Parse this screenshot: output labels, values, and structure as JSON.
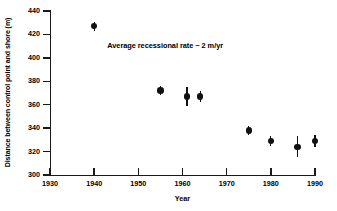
{
  "chart_data": {
    "type": "scatter",
    "title": "",
    "xlabel": "Year",
    "ylabel": "Distance between control point and shore (m)",
    "xlim": [
      1930,
      1990
    ],
    "ylim": [
      300,
      440
    ],
    "grid": false,
    "legend": "none",
    "xticks": [
      1930,
      1940,
      1950,
      1960,
      1970,
      1980,
      1990
    ],
    "yticks": [
      300,
      320,
      340,
      360,
      380,
      400,
      420,
      440
    ],
    "annotations": [
      {
        "text": "Average recessional rate ~ 2 m/yr",
        "x": 1957,
        "y": 411
      }
    ],
    "series": [
      {
        "name": "Shoreline position",
        "points": [
          {
            "x": 1940,
            "y": 427,
            "yerr": 4
          },
          {
            "x": 1955,
            "y": 372,
            "yerr": 4
          },
          {
            "x": 1961,
            "y": 367,
            "yerr": 8
          },
          {
            "x": 1964,
            "y": 367,
            "yerr": 5
          },
          {
            "x": 1975,
            "y": 338,
            "yerr": 4
          },
          {
            "x": 1980,
            "y": 329,
            "yerr": 4
          },
          {
            "x": 1986,
            "y": 324,
            "yerr": 9
          },
          {
            "x": 1990,
            "y": 329,
            "yerr": 5
          }
        ]
      }
    ]
  }
}
